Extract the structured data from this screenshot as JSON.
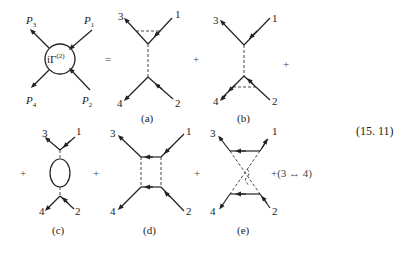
{
  "lhs": {
    "vertex_label": "iΓ",
    "vertex_sup": "(2)",
    "legs": [
      "P1",
      "P2",
      "P3",
      "P4"
    ],
    "leg_labels": {
      "p1": "P",
      "p1_sub": "1",
      "p2": "P",
      "p2_sub": "2",
      "p3": "P",
      "p3_sub": "3",
      "p4": "P",
      "p4_sub": "4"
    }
  },
  "operators": {
    "equals": "=",
    "plus": "+"
  },
  "diagrams": [
    {
      "id": "a",
      "caption": "(a)",
      "labels": {
        "top_left": "3",
        "top_right": "1",
        "bottom_left": "4",
        "bottom_right": "2"
      }
    },
    {
      "id": "b",
      "caption": "(b)",
      "labels": {
        "top_left": "3",
        "top_right": "1",
        "bottom_left": "4",
        "bottom_right": "2"
      }
    },
    {
      "id": "c",
      "caption": "(c)",
      "labels": {
        "top_left": "3",
        "top_right": "1",
        "bottom_left": "4",
        "bottom_right": "2"
      }
    },
    {
      "id": "d",
      "caption": "(d)",
      "labels": {
        "top_left": "3",
        "top_right": "1",
        "bottom_left": "4",
        "bottom_right": "2"
      }
    },
    {
      "id": "e",
      "caption": "(e)",
      "labels": {
        "top_left": "3",
        "top_right": "1",
        "bottom_left": "4",
        "bottom_right": "2"
      }
    }
  ],
  "exchange_term": "+(3 ↔ 4)",
  "equation_number": "(15. 11)"
}
